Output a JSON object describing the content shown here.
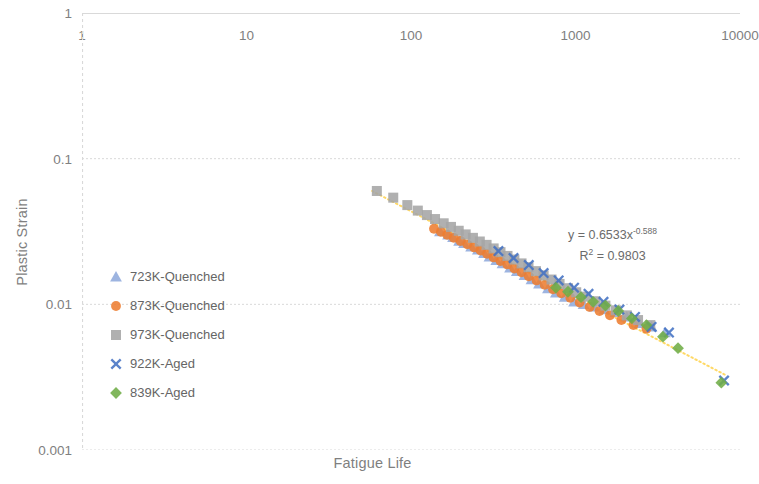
{
  "chart_data": {
    "type": "scatter",
    "title": "",
    "xlabel": "Fatigue Life",
    "ylabel": "Plastic Strain",
    "xscale": "log",
    "yscale": "log",
    "xlim": [
      1,
      10000
    ],
    "ylim": [
      0.001,
      1
    ],
    "x_axis_position": "top",
    "grid": true,
    "legend_position": "inside-left",
    "xticks": [
      "1",
      "10",
      "100",
      "1000",
      "10000"
    ],
    "xtick_values": [
      1,
      10,
      100,
      1000,
      10000
    ],
    "yticks": [
      "1",
      "0.1",
      "0.01",
      "0.001"
    ],
    "ytick_values": [
      1,
      0.1,
      0.01,
      0.001
    ],
    "annotations": [
      {
        "line1": "y = 0.6533x",
        "exponent": "-0.588",
        "line2_pre": "R",
        "line2_sup": "2",
        "line2_post": " = 0.9803"
      }
    ],
    "trendline": {
      "type": "power",
      "coefficient": 0.6533,
      "exponent": -0.588,
      "r_squared": 0.9803,
      "color": "#FFD966",
      "style": "dotted",
      "x_start": 58,
      "x_end": 8200
    },
    "series": [
      {
        "name": "723K-Quenched",
        "marker": "triangle",
        "color": "#8FAADC",
        "points": [
          [
            150,
            0.0315
          ],
          [
            168,
            0.03
          ],
          [
            180,
            0.0288
          ],
          [
            196,
            0.0272
          ],
          [
            210,
            0.0262
          ],
          [
            232,
            0.0248
          ],
          [
            255,
            0.0236
          ],
          [
            278,
            0.0224
          ],
          [
            300,
            0.0212
          ],
          [
            330,
            0.02
          ],
          [
            360,
            0.019
          ],
          [
            400,
            0.0178
          ],
          [
            440,
            0.0168
          ],
          [
            490,
            0.0158
          ],
          [
            540,
            0.0148
          ],
          [
            600,
            0.0138
          ],
          [
            680,
            0.0128
          ],
          [
            760,
            0.012
          ],
          [
            860,
            0.0112
          ],
          [
            980,
            0.0104
          ],
          [
            1120,
            0.01
          ],
          [
            1300,
            0.0096
          ],
          [
            1500,
            0.0092
          ],
          [
            1750,
            0.0088
          ],
          [
            2050,
            0.0082
          ],
          [
            2450,
            0.0074
          ],
          [
            2900,
            0.007
          ],
          [
            3500,
            0.0064
          ]
        ]
      },
      {
        "name": "873K-Quenched",
        "marker": "circle",
        "color": "#ED7D31",
        "points": [
          [
            138,
            0.033
          ],
          [
            152,
            0.0315
          ],
          [
            166,
            0.03
          ],
          [
            182,
            0.0286
          ],
          [
            200,
            0.0272
          ],
          [
            220,
            0.0258
          ],
          [
            242,
            0.0246
          ],
          [
            265,
            0.0234
          ],
          [
            290,
            0.0222
          ],
          [
            318,
            0.021
          ],
          [
            350,
            0.0198
          ],
          [
            385,
            0.0188
          ],
          [
            425,
            0.0176
          ],
          [
            470,
            0.0166
          ],
          [
            520,
            0.0156
          ],
          [
            580,
            0.0146
          ],
          [
            650,
            0.0136
          ],
          [
            730,
            0.0127
          ],
          [
            820,
            0.0119
          ],
          [
            930,
            0.0111
          ],
          [
            1060,
            0.0103
          ],
          [
            1220,
            0.0096
          ],
          [
            1400,
            0.009
          ],
          [
            1620,
            0.0084
          ],
          [
            1900,
            0.0078
          ],
          [
            2250,
            0.0072
          ],
          [
            2700,
            0.0068
          ]
        ]
      },
      {
        "name": "973K-Quenched",
        "marker": "square",
        "color": "#A5A5A5",
        "points": [
          [
            62,
            0.06
          ],
          [
            78,
            0.054
          ],
          [
            95,
            0.048
          ],
          [
            110,
            0.044
          ],
          [
            125,
            0.041
          ],
          [
            140,
            0.0385
          ],
          [
            158,
            0.036
          ],
          [
            175,
            0.034
          ],
          [
            195,
            0.032
          ],
          [
            215,
            0.0302
          ],
          [
            238,
            0.0286
          ],
          [
            262,
            0.027
          ],
          [
            288,
            0.0256
          ],
          [
            318,
            0.0242
          ],
          [
            350,
            0.0228
          ],
          [
            386,
            0.0215
          ],
          [
            425,
            0.0203
          ],
          [
            470,
            0.0191
          ],
          [
            518,
            0.018
          ],
          [
            575,
            0.0169
          ],
          [
            640,
            0.0158
          ],
          [
            715,
            0.0148
          ],
          [
            800,
            0.0138
          ],
          [
            900,
            0.0129
          ],
          [
            1010,
            0.0121
          ],
          [
            1150,
            0.0113
          ],
          [
            1320,
            0.0105
          ],
          [
            1520,
            0.0098
          ],
          [
            1760,
            0.0091
          ],
          [
            2050,
            0.0084
          ],
          [
            2400,
            0.0078
          ],
          [
            2850,
            0.0072
          ]
        ]
      },
      {
        "name": "922K-Aged",
        "marker": "x",
        "color": "#4472C4",
        "points": [
          [
            340,
            0.0232
          ],
          [
            420,
            0.0208
          ],
          [
            520,
            0.0186
          ],
          [
            640,
            0.0164
          ],
          [
            790,
            0.0146
          ],
          [
            980,
            0.013
          ],
          [
            1200,
            0.0118
          ],
          [
            1480,
            0.0104
          ],
          [
            1850,
            0.0092
          ],
          [
            2300,
            0.0082
          ],
          [
            2900,
            0.007
          ],
          [
            3700,
            0.0064
          ],
          [
            8000,
            0.003
          ]
        ]
      },
      {
        "name": "839K-Aged",
        "marker": "diamond",
        "color": "#70AD47",
        "points": [
          [
            760,
            0.013
          ],
          [
            900,
            0.0122
          ],
          [
            1080,
            0.0112
          ],
          [
            1280,
            0.0104
          ],
          [
            1520,
            0.0098
          ],
          [
            1820,
            0.009
          ],
          [
            2200,
            0.008
          ],
          [
            2700,
            0.0072
          ],
          [
            3400,
            0.006
          ],
          [
            4200,
            0.005
          ],
          [
            7700,
            0.0029
          ]
        ]
      }
    ]
  },
  "legend": {
    "items": [
      {
        "label": "723K-Quenched",
        "marker": "triangle",
        "color": "#8FAADC"
      },
      {
        "label": "873K-Quenched",
        "marker": "circle",
        "color": "#ED7D31"
      },
      {
        "label": "973K-Quenched",
        "marker": "square",
        "color": "#A5A5A5"
      },
      {
        "label": "922K-Aged",
        "marker": "x",
        "color": "#4472C4"
      },
      {
        "label": "839K-Aged",
        "marker": "diamond",
        "color": "#70AD47"
      }
    ]
  },
  "axes": {
    "x_title": "Fatigue Life",
    "y_title": "Plastic Strain"
  },
  "colors": {
    "grid": "#D9D9D9",
    "axis_line": "#D9D9D9",
    "text": "#808080",
    "trendline": "#FFD966"
  }
}
